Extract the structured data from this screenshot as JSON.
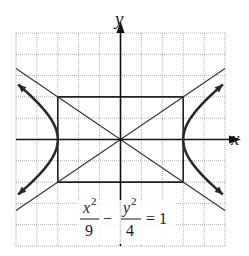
{
  "chart_data": {
    "type": "line",
    "title": "",
    "equation": {
      "lhs_term1_num": "x",
      "lhs_term1_num_exp": "2",
      "lhs_term1_den": "9",
      "operator": "−",
      "lhs_term2_num": "y",
      "lhs_term2_num_exp": "2",
      "lhs_term2_den": "4",
      "rhs": "= 1"
    },
    "xlabel": "x",
    "ylabel": "y",
    "xlim": [
      -5,
      5
    ],
    "ylim": [
      -5,
      5
    ],
    "grid": true,
    "grid_step": 1,
    "series": [
      {
        "name": "hyperbola right branch",
        "x": [
          3.0,
          3.2,
          3.6,
          4.2,
          5.0
        ],
        "y_upper": [
          0,
          0.74,
          1.33,
          1.96,
          2.67
        ],
        "y_lower": [
          0,
          -0.74,
          -1.33,
          -1.96,
          -2.67
        ]
      },
      {
        "name": "hyperbola left branch",
        "x": [
          -3.0,
          -3.2,
          -3.6,
          -4.2,
          -5.0
        ],
        "y_upper": [
          0,
          0.74,
          1.33,
          1.96,
          2.67
        ],
        "y_lower": [
          0,
          -0.74,
          -1.33,
          -1.96,
          -2.67
        ]
      },
      {
        "name": "asymptote y = 2x/3",
        "x": [
          -5,
          5
        ],
        "y": [
          -3.33,
          3.33
        ]
      },
      {
        "name": "asymptote y = -2x/3",
        "x": [
          -5,
          5
        ],
        "y": [
          3.33,
          -3.33
        ]
      },
      {
        "name": "fundamental rectangle",
        "x": [
          -3,
          3,
          3,
          -3,
          -3
        ],
        "y": [
          2,
          2,
          -2,
          -2,
          2
        ]
      }
    ]
  }
}
